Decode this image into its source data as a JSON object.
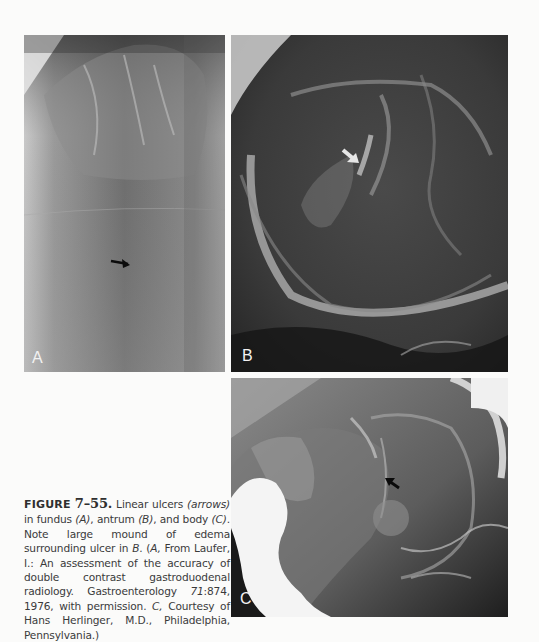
{
  "figure": {
    "label_word": "FIGURE",
    "number": "7–55.",
    "caption_parts": {
      "p1": " Linear ulcers ",
      "p1_italic": "(arrows)",
      "p2": " in fundus ",
      "p2_italic": "(A)",
      "p3": ", antrum ",
      "p3_italic": "(B)",
      "p4": ", and body ",
      "p4_italic": "(C)",
      "p5": ". Note large mound of edema surrounding ulcer in ",
      "p5_italic": "B",
      "p6": ". (",
      "p6_italic": "A,",
      "p7": " From Laufer, I.: An assessment of the accuracy of double contrast gastroduodenal radiology. Gastroenterology ",
      "p7_italic": "71",
      "p8": ":874, 1976, with permission. ",
      "p8_italic": "C,",
      "p9": " Courtesy of Hans Herlinger, M.D., Philadelphia, Pennsylvania.)"
    }
  },
  "panels": [
    {
      "id": "A",
      "label": "A",
      "description": "Radiograph of gastric fundus with black arrow marking linear ulcer"
    },
    {
      "id": "B",
      "label": "B",
      "description": "Radiograph of gastric antrum with white arrow marking linear ulcer with surrounding edema"
    },
    {
      "id": "C",
      "label": "C",
      "description": "Radiograph of gastric body with black arrow marking linear ulcer"
    }
  ],
  "colors": {
    "page_background": "#fbfbfa",
    "caption_text": "#3a3a3a",
    "panel_label": "#f2f2f2"
  }
}
